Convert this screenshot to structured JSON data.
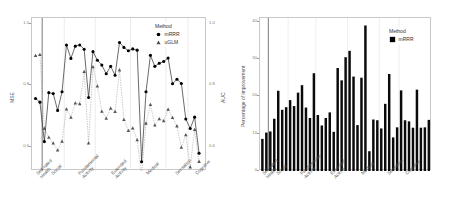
{
  "chart_data": [
    {
      "type": "scatter",
      "panel": "left",
      "title": "",
      "xlabel": "",
      "ylabel": "MSE",
      "ylabel_right": "AUC",
      "ylim": [
        0.52,
        1.02
      ],
      "yticks": [
        "1.0",
        "0.8",
        "0.6"
      ],
      "ytick_values": [
        1.0,
        0.8,
        0.6
      ],
      "yticks_right": [
        "1.0",
        "0.8",
        "0.6"
      ],
      "ytick_values_right": [
        1.0,
        0.8,
        0.6
      ],
      "grid": "vertical-group-separators",
      "legend": {
        "title": "Method",
        "position": "top-right",
        "entries": [
          {
            "label": "mRRR",
            "marker": "filled-circle",
            "color": "#000000"
          },
          {
            "label": "uGLM",
            "marker": "filled-triangle",
            "color": "#4d4d4d"
          }
        ]
      },
      "groups": [
        {
          "name": "Self-rated Health",
          "label_lines": [
            "Self-rated",
            "Health"
          ],
          "n": 2
        },
        {
          "name": "Social",
          "label_lines": [
            "Social"
          ],
          "n": 5
        },
        {
          "name": "Fundamental Activity",
          "label_lines": [
            "Fundamental",
            "Activity"
          ],
          "n": 7
        },
        {
          "name": "Extended Activity",
          "label_lines": [
            "Extended",
            "Activity"
          ],
          "n": 8
        },
        {
          "name": "Medical",
          "label_lines": [
            "Medical"
          ],
          "n": 8
        },
        {
          "name": "Sensation",
          "label_lines": [
            "Sensation"
          ],
          "n": 5
        },
        {
          "name": "Cognitive",
          "label_lines": [
            "Cognitive"
          ],
          "n": 4
        }
      ],
      "series": [
        {
          "name": "mRRR",
          "marker": "filled-circle",
          "values": [
            0.757,
            0.745,
            0.616,
            0.776,
            0.773,
            0.718,
            0.779,
            0.932,
            0.888,
            0.928,
            0.932,
            0.918,
            0.76,
            0.91,
            0.882,
            0.866,
            0.838,
            0.862,
            0.833,
            0.94,
            0.924,
            0.913,
            0.919,
            0.915,
            0.55,
            0.779,
            0.898,
            0.862,
            0.872,
            0.878,
            0.889,
            0.805,
            0.82,
            0.806,
            0.69,
            0.659,
            0.696,
            0.578
          ]
        },
        {
          "name": "uGLM",
          "marker": "filled-triangle",
          "values": [
            0.897,
            0.9,
            0.659,
            0.63,
            0.611,
            0.588,
            0.617,
            0.722,
            0.695,
            0.742,
            0.739,
            0.845,
            0.611,
            0.86,
            0.797,
            0.715,
            0.692,
            0.725,
            0.714,
            0.85,
            0.688,
            0.652,
            0.66,
            0.622,
            0.506,
            0.676,
            0.737,
            0.67,
            0.69,
            0.684,
            0.721,
            0.694,
            0.667,
            0.597,
            0.638,
            0.533,
            0.655,
            0.551
          ]
        }
      ]
    },
    {
      "type": "bar",
      "panel": "right",
      "title": "",
      "xlabel": "",
      "ylabel": "Percentage of improvement",
      "ylim": [
        0,
        41
      ],
      "yticks": [
        "0",
        "10",
        "20",
        "30",
        "40"
      ],
      "ytick_values": [
        0,
        10,
        20,
        30,
        40
      ],
      "grid": "vertical-group-separators",
      "legend": {
        "title": "Method",
        "position": "top-right",
        "entries": [
          {
            "label": "mRRR",
            "marker": "filled-square",
            "color": "#000000"
          }
        ]
      },
      "groups": [
        {
          "name": "Self-rated Health",
          "label_lines": [
            "Self-rated",
            "Health"
          ],
          "n": 2
        },
        {
          "name": "Social",
          "label_lines": [
            "Social"
          ],
          "n": 5
        },
        {
          "name": "Fundamental Activity",
          "label_lines": [
            "Fundamental",
            "Activity"
          ],
          "n": 7
        },
        {
          "name": "Extended Activity",
          "label_lines": [
            "Extended",
            "Activity"
          ],
          "n": 8
        },
        {
          "name": "Medical",
          "label_lines": [
            "Medical"
          ],
          "n": 8
        },
        {
          "name": "Sensation",
          "label_lines": [
            "Sensation"
          ],
          "n": 5
        },
        {
          "name": "Cognitive",
          "label_lines": [
            "Cognitive"
          ],
          "n": 4
        }
      ],
      "series": [
        {
          "name": "mRRR",
          "values": [
            8.6,
            10.3,
            10.6,
            14.0,
            21.5,
            16.4,
            17.1,
            19.0,
            17.4,
            21.0,
            23.0,
            17.0,
            14.2,
            26.2,
            15.0,
            12.2,
            14.2,
            15.7,
            10.5,
            27.6,
            24.3,
            30.5,
            32.2,
            25.3,
            12.3,
            25.0,
            39.0,
            5.3,
            13.8,
            13.6,
            11.4,
            18.0,
            26.0,
            9.0,
            11.7,
            21.6,
            13.6,
            13.3,
            11.6,
            21.8,
            11.6,
            11.7,
            13.7
          ]
        }
      ]
    }
  ]
}
